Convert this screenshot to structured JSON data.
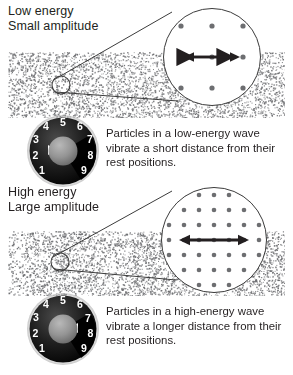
{
  "figure": {
    "title_low": "Low energy\nSmall amplitude",
    "title_high": "High energy\nLarge amplitude",
    "caption_low": "Particles in a low-energy wave vibrate a short distance from their rest positions.",
    "caption_high": "Particles in a high-energy wave vibrate a longer distance from their rest positions.",
    "ink_color": "#231f20",
    "stipple_color": "#6d6e71",
    "line_color": "#3b3b3b"
  },
  "panels": [
    {
      "id": "low",
      "energy_label": "Low energy",
      "amplitude_label": "Small amplitude",
      "dial": {
        "numbers": [
          "1",
          "2",
          "3",
          "4",
          "5",
          "6",
          "7",
          "8",
          "9"
        ],
        "selected_value": "3",
        "pointer_direction": "left",
        "face_color": "#1a1a1a",
        "hub_color": "#8a8a8a",
        "number_color": "#ffffff"
      },
      "magnifier": {
        "dot_columns": 3,
        "dot_rows": 3,
        "dot_spacing_px": 31,
        "dot_color": "#6d6e71",
        "arrow_length_px": 42,
        "arrow_label": "short vibration distance"
      },
      "medium": {
        "compression_bands": 0,
        "density": "uniform",
        "description": "evenly stippled medium with small-amplitude particle motion"
      },
      "caption": "Particles in a low-energy wave vibrate a short distance from their rest positions."
    },
    {
      "id": "high",
      "energy_label": "High energy",
      "amplitude_label": "Large amplitude",
      "dial": {
        "numbers": [
          "1",
          "2",
          "3",
          "4",
          "5",
          "6",
          "7",
          "8",
          "9"
        ],
        "selected_value": "7",
        "pointer_direction": "right",
        "face_color": "#1a1a1a",
        "hub_color": "#8a8a8a",
        "number_color": "#ffffff"
      },
      "magnifier": {
        "dot_columns": 7,
        "dot_rows": 7,
        "dot_spacing_px": 15,
        "dot_color": "#6d6e71",
        "arrow_length_px": 66,
        "arrow_label": "longer vibration distance"
      },
      "medium": {
        "compression_bands": 3,
        "density": "banded",
        "description": "stippled medium showing dense compressions and sparse rarefactions"
      },
      "caption": "Particles in a high-energy wave vibrate a longer distance from their rest positions."
    }
  ],
  "callouts": [
    {
      "panel": "low",
      "source_circle_radius_px": 9,
      "target": "magnifier-low"
    },
    {
      "panel": "high",
      "source_circle_radius_px": 9,
      "target": "magnifier-high"
    }
  ]
}
